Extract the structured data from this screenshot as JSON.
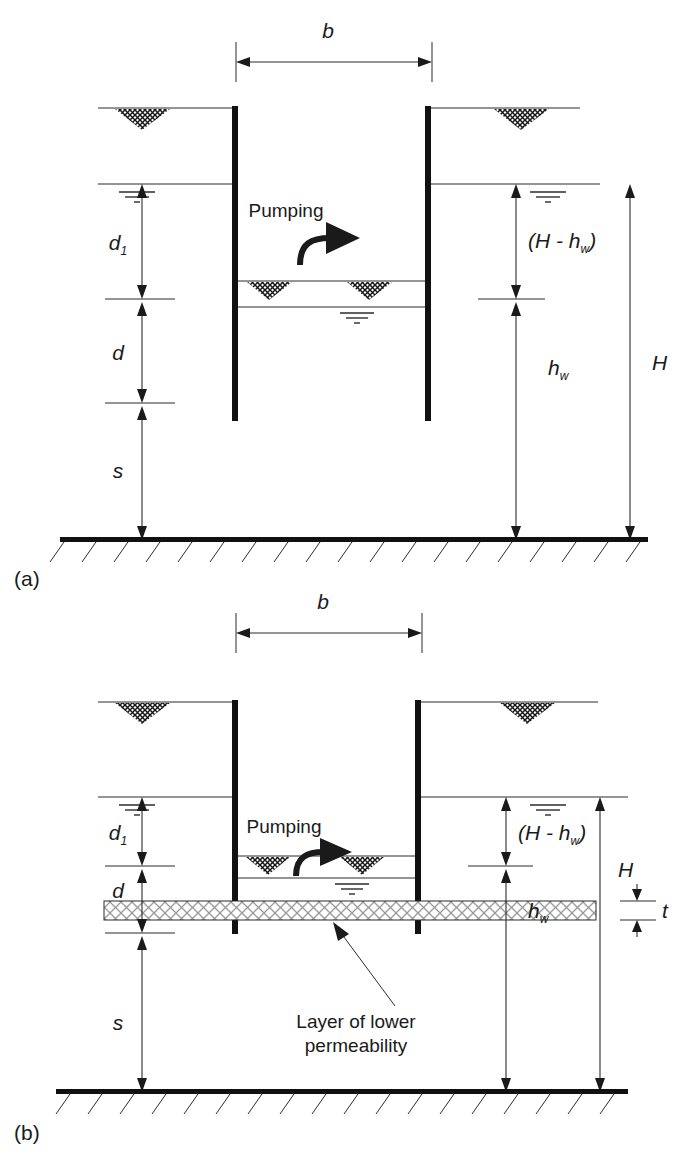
{
  "figure": {
    "panels": [
      {
        "id": "a",
        "label": "(a)",
        "caption_note": "Homogeneous permeable soil",
        "labels": {
          "width_b": "b",
          "depth_d1": "d",
          "depth_d1_sub": "1",
          "depth_d": "d",
          "depth_s": "s",
          "head_diff": "(H - h",
          "head_diff_sub": "w",
          "head_diff_close": ")",
          "head_hw": "h",
          "head_hw_sub": "w",
          "total_H": "H",
          "pumping": "Pumping"
        }
      },
      {
        "id": "b",
        "label": "(b)",
        "caption_note": "With low permeability layer",
        "labels": {
          "width_b": "b",
          "depth_d1": "d",
          "depth_d1_sub": "1",
          "depth_d": "d",
          "depth_s": "s",
          "head_diff": "(H - h",
          "head_diff_sub": "w",
          "head_diff_close": ")",
          "head_hw": "h",
          "head_hw_sub": "w",
          "total_H": "H",
          "thickness_t": "t",
          "pumping": "Pumping",
          "layer_note_line1": "Layer of lower",
          "layer_note_line2": "permeability"
        }
      }
    ],
    "icons": {
      "ground_surface": "ground-surface-hatch-icon",
      "water_table": "water-table-icon",
      "pumping_arrow": "pumping-arrow-icon",
      "leader_arrow": "leader-arrow-icon",
      "bedrock_hatch": "bedrock-hatch-icon",
      "low_perm_hatch": "cross-hatch-icon"
    },
    "colors": {
      "ink": "#1a1a1a",
      "line": "#2b2b2b",
      "paper": "#ffffff",
      "hatch": "#8a8a8a"
    }
  }
}
